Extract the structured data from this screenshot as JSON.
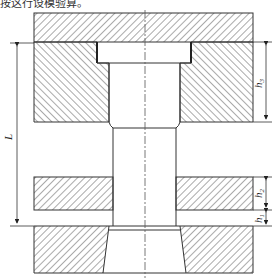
{
  "caption": "按这行设模验算。",
  "diagram": {
    "type": "engineering cross-section of die set",
    "colors": {
      "line": "#333333",
      "hatch": "#555555",
      "background": "#ffffff"
    },
    "dimensions": {
      "L": {
        "label": "L",
        "subscript": ""
      },
      "h3": {
        "label": "h",
        "subscript": "3"
      },
      "h2": {
        "label": "h",
        "subscript": "2"
      },
      "h1": {
        "label": "h",
        "subscript": "1"
      }
    },
    "parts": [
      "top-plate",
      "upper-die",
      "middle-plate",
      "lower-die",
      "center-bore",
      "centerline"
    ]
  }
}
